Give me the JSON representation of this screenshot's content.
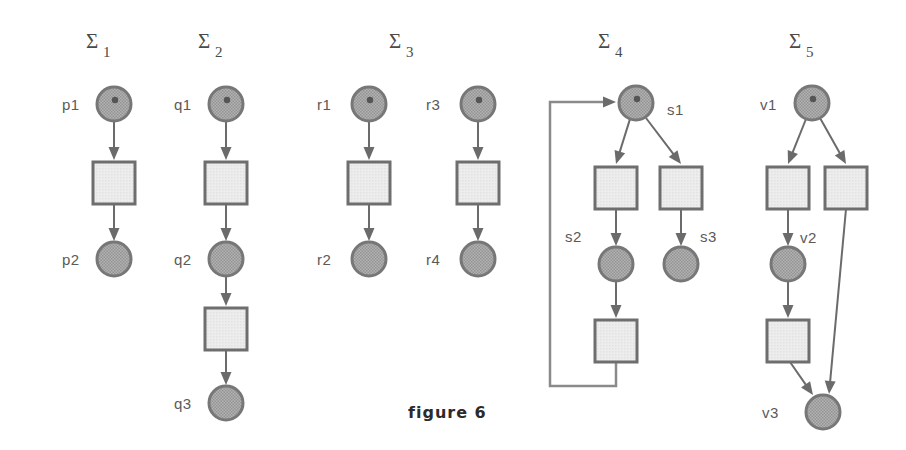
{
  "figure": {
    "caption": "figure 6",
    "caption_x": 408,
    "caption_y": 418,
    "width": 906,
    "height": 450,
    "background": "#ffffff"
  },
  "style": {
    "place_fill": "#a9a9a9",
    "place_stroke": "#777777",
    "transition_fill": "#e9e9e9",
    "transition_stroke": "#6e6e6e",
    "arc_color": "#6b6b6b",
    "loop_color": "#8a8a8a",
    "token_color": "#555555",
    "label_color": "#5a5a5a",
    "sigma_color": "#4a4a4a",
    "caption_color": "#2b2b2b"
  },
  "nets": [
    {
      "id": "sigma-1",
      "title": "Σ",
      "subscript": "1",
      "title_x": 86,
      "title_y": 48,
      "places": [
        {
          "id": "p1",
          "label": "p1",
          "cx": 114,
          "cy": 104,
          "r": 17,
          "token": true,
          "label_x": 62,
          "label_y": 110
        },
        {
          "id": "p2",
          "label": "p2",
          "cx": 114,
          "cy": 259,
          "r": 17,
          "token": false,
          "label_x": 62,
          "label_y": 265
        }
      ],
      "transitions": [
        {
          "id": "t1",
          "x": 93,
          "y": 162,
          "w": 42,
          "h": 42
        }
      ],
      "arcs": [
        {
          "from": "p1",
          "to": "t1",
          "x1": 114,
          "y1": 121,
          "x2": 114,
          "y2": 160
        },
        {
          "from": "t1",
          "to": "p2",
          "x1": 114,
          "y1": 204,
          "x2": 114,
          "y2": 241
        }
      ]
    },
    {
      "id": "sigma-2",
      "title": "Σ",
      "subscript": "2",
      "title_x": 198,
      "title_y": 48,
      "places": [
        {
          "id": "q1",
          "label": "q1",
          "cx": 226,
          "cy": 104,
          "r": 17,
          "token": true,
          "label_x": 174,
          "label_y": 110
        },
        {
          "id": "q2",
          "label": "q2",
          "cx": 226,
          "cy": 259,
          "r": 17,
          "token": false,
          "label_x": 174,
          "label_y": 265
        },
        {
          "id": "q3",
          "label": "q3",
          "cx": 226,
          "cy": 403,
          "r": 17,
          "token": false,
          "label_x": 174,
          "label_y": 409
        }
      ],
      "transitions": [
        {
          "id": "t1",
          "x": 205,
          "y": 162,
          "w": 42,
          "h": 42
        },
        {
          "id": "t2",
          "x": 205,
          "y": 308,
          "w": 42,
          "h": 42
        }
      ],
      "arcs": [
        {
          "from": "q1",
          "to": "t1",
          "x1": 226,
          "y1": 121,
          "x2": 226,
          "y2": 160
        },
        {
          "from": "t1",
          "to": "q2",
          "x1": 226,
          "y1": 204,
          "x2": 226,
          "y2": 241
        },
        {
          "from": "q2",
          "to": "t2",
          "x1": 226,
          "y1": 276,
          "x2": 226,
          "y2": 306
        },
        {
          "from": "t2",
          "to": "q3",
          "x1": 226,
          "y1": 350,
          "x2": 226,
          "y2": 385
        }
      ]
    },
    {
      "id": "sigma-3",
      "title": "Σ",
      "subscript": "3",
      "title_x": 389,
      "title_y": 48,
      "places": [
        {
          "id": "r1",
          "label": "r1",
          "cx": 369,
          "cy": 104,
          "r": 17,
          "token": true,
          "label_x": 317,
          "label_y": 110
        },
        {
          "id": "r2",
          "label": "r2",
          "cx": 369,
          "cy": 259,
          "r": 17,
          "token": false,
          "label_x": 317,
          "label_y": 265
        },
        {
          "id": "r3",
          "label": "r3",
          "cx": 478,
          "cy": 104,
          "r": 17,
          "token": true,
          "label_x": 426,
          "label_y": 110
        },
        {
          "id": "r4",
          "label": "r4",
          "cx": 478,
          "cy": 259,
          "r": 17,
          "token": false,
          "label_x": 426,
          "label_y": 265
        }
      ],
      "transitions": [
        {
          "id": "t1",
          "x": 348,
          "y": 162,
          "w": 42,
          "h": 42
        },
        {
          "id": "t2",
          "x": 457,
          "y": 162,
          "w": 42,
          "h": 42
        }
      ],
      "arcs": [
        {
          "from": "r1",
          "to": "t1",
          "x1": 369,
          "y1": 121,
          "x2": 369,
          "y2": 160
        },
        {
          "from": "t1",
          "to": "r2",
          "x1": 369,
          "y1": 204,
          "x2": 369,
          "y2": 241
        },
        {
          "from": "r3",
          "to": "t2",
          "x1": 478,
          "y1": 121,
          "x2": 478,
          "y2": 160
        },
        {
          "from": "t2",
          "to": "r4",
          "x1": 478,
          "y1": 204,
          "x2": 478,
          "y2": 241
        }
      ]
    },
    {
      "id": "sigma-4",
      "title": "Σ",
      "subscript": "4",
      "title_x": 598,
      "title_y": 48,
      "places": [
        {
          "id": "s1",
          "label": "s1",
          "cx": 636,
          "cy": 103,
          "r": 17,
          "token": true,
          "label_x": 667,
          "label_y": 115
        },
        {
          "id": "s2",
          "label": "s2",
          "cx": 616,
          "cy": 264,
          "r": 17,
          "token": false,
          "label_x": 565,
          "label_y": 242
        },
        {
          "id": "s3",
          "label": "s3",
          "cx": 681,
          "cy": 264,
          "r": 17,
          "token": false,
          "label_x": 700,
          "label_y": 242
        }
      ],
      "transitions": [
        {
          "id": "t1",
          "x": 595,
          "y": 167,
          "w": 42,
          "h": 42
        },
        {
          "id": "t2",
          "x": 660,
          "y": 167,
          "w": 42,
          "h": 42
        },
        {
          "id": "t3",
          "x": 595,
          "y": 320,
          "w": 42,
          "h": 42
        }
      ],
      "arcs": [
        {
          "from": "s1",
          "to": "t1",
          "x1": 630,
          "y1": 119,
          "x2": 616,
          "y2": 164
        },
        {
          "from": "s1",
          "to": "t2",
          "x1": 646,
          "y1": 118,
          "x2": 681,
          "y2": 164
        },
        {
          "from": "t1",
          "to": "s2",
          "x1": 616,
          "y1": 209,
          "x2": 616,
          "y2": 246
        },
        {
          "from": "t2",
          "to": "s3",
          "x1": 681,
          "y1": 209,
          "x2": 681,
          "y2": 246
        },
        {
          "from": "s2",
          "to": "t3",
          "x1": 616,
          "y1": 281,
          "x2": 616,
          "y2": 318
        }
      ],
      "feedback": {
        "id": "loop-t3-s1",
        "path": "M 616 362 L 616 386 L 550 386 L 550 102 L 606 102",
        "arrow_x": 616,
        "arrow_y": 102
      }
    },
    {
      "id": "sigma-5",
      "title": "Σ",
      "subscript": "5",
      "title_x": 789,
      "title_y": 48,
      "places": [
        {
          "id": "v1",
          "label": "v1",
          "cx": 812,
          "cy": 103,
          "r": 17,
          "token": true,
          "label_x": 760,
          "label_y": 110
        },
        {
          "id": "v2",
          "label": "v2",
          "cx": 788,
          "cy": 264,
          "r": 17,
          "token": false,
          "label_x": 800,
          "label_y": 243
        },
        {
          "id": "v3",
          "label": "v3",
          "cx": 823,
          "cy": 412,
          "r": 17,
          "token": false,
          "label_x": 762,
          "label_y": 418
        }
      ],
      "transitions": [
        {
          "id": "t1",
          "x": 767,
          "y": 167,
          "w": 42,
          "h": 42
        },
        {
          "id": "t2",
          "x": 825,
          "y": 167,
          "w": 42,
          "h": 42
        },
        {
          "id": "t3",
          "x": 767,
          "y": 320,
          "w": 42,
          "h": 42
        }
      ],
      "arcs": [
        {
          "from": "v1",
          "to": "t1",
          "x1": 806,
          "y1": 119,
          "x2": 788,
          "y2": 164
        },
        {
          "from": "v1",
          "to": "t2",
          "x1": 820,
          "y1": 118,
          "x2": 846,
          "y2": 164
        },
        {
          "from": "t1",
          "to": "v2",
          "x1": 788,
          "y1": 209,
          "x2": 788,
          "y2": 246
        },
        {
          "from": "v2",
          "to": "t3",
          "x1": 788,
          "y1": 281,
          "x2": 788,
          "y2": 318
        },
        {
          "from": "t3",
          "to": "v3",
          "x1": 790,
          "y1": 362,
          "x2": 813,
          "y2": 395
        },
        {
          "from": "t2",
          "to": "v3",
          "x1": 846,
          "y1": 209,
          "x2": 829,
          "y2": 394
        }
      ]
    }
  ]
}
